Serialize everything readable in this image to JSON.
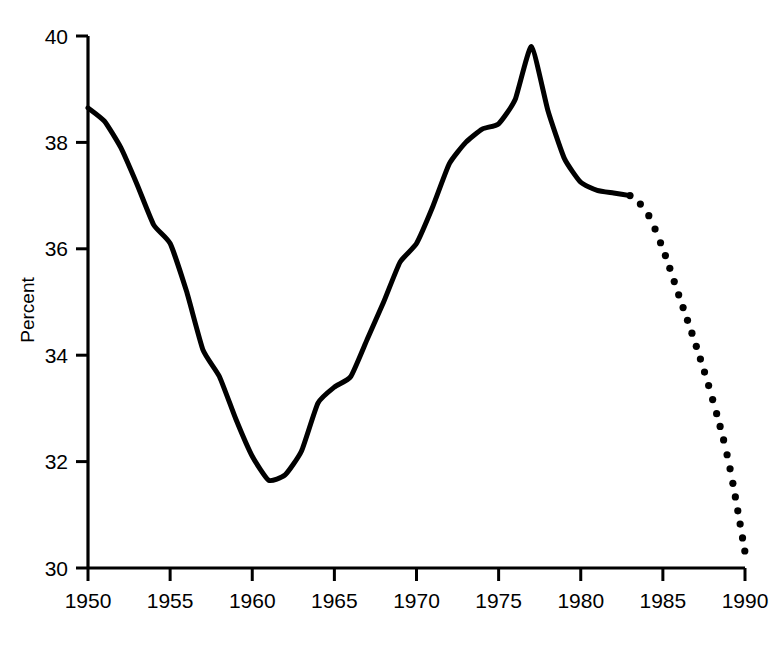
{
  "chart_data": {
    "type": "line",
    "title": "",
    "subtitle": "",
    "xlabel": "",
    "ylabel": "Percent",
    "xlim": [
      1950,
      1990
    ],
    "ylim": [
      30,
      40
    ],
    "grid": false,
    "legend": "none",
    "x_ticks": [
      1950,
      1955,
      1960,
      1965,
      1970,
      1975,
      1980,
      1985,
      1990
    ],
    "y_ticks": [
      30,
      32,
      34,
      36,
      38,
      40
    ],
    "x_tick_labels": [
      "1950",
      "1955",
      "1960",
      "1965",
      "1970",
      "1975",
      "1980",
      "1985",
      "1990"
    ],
    "y_tick_labels": [
      "30",
      "32",
      "34",
      "36",
      "38",
      "40"
    ],
    "series": [
      {
        "name": "historical",
        "style": "solid",
        "color": "#000000",
        "x": [
          1950,
          1951,
          1952,
          1953,
          1954,
          1955,
          1956,
          1957,
          1958,
          1959,
          1960,
          1961,
          1962,
          1963,
          1964,
          1965,
          1966,
          1967,
          1968,
          1969,
          1970,
          1971,
          1972,
          1973,
          1974,
          1975,
          1976,
          1977,
          1978,
          1979,
          1980,
          1981,
          1982,
          1983
        ],
        "values": [
          38.65,
          38.4,
          37.9,
          37.2,
          36.45,
          36.1,
          35.2,
          34.1,
          33.6,
          32.8,
          32.1,
          31.65,
          31.75,
          32.2,
          33.1,
          33.4,
          33.6,
          34.3,
          35.0,
          35.75,
          36.1,
          36.8,
          37.6,
          38.0,
          38.25,
          38.35,
          38.8,
          39.8,
          38.6,
          37.7,
          37.25,
          37.1,
          37.05,
          37.0
        ]
      },
      {
        "name": "projected",
        "style": "dotted",
        "color": "#000000",
        "x": [
          1983,
          1984,
          1985,
          1986,
          1987,
          1988,
          1989,
          1990
        ],
        "values": [
          37.0,
          36.7,
          36.0,
          35.1,
          34.2,
          33.2,
          32.0,
          30.3
        ]
      }
    ]
  }
}
